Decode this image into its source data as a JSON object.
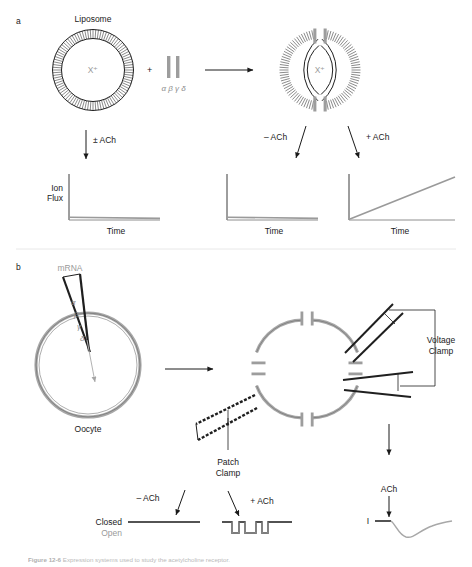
{
  "figure": {
    "panels": [
      {
        "id": "a",
        "letter": "a"
      },
      {
        "id": "b",
        "letter": "b"
      }
    ],
    "caption_prefix": "Figure 12-6",
    "caption_text": "Expression systems used to study the acetylcholine receptor."
  },
  "panel_a": {
    "letter": "a",
    "liposome_label": "Liposome",
    "ion_label": "X⁺",
    "plus_sign": "+",
    "subunits_label": "α β γ δ",
    "reconstituted_ion_label": "X⁺",
    "arrow_down_label": "± ACh",
    "minus_ach_label": "– ACh",
    "plus_ach_label": "+ ACh",
    "graphs": [
      {
        "name": "liposome-alone",
        "ylabel_line1": "Ion",
        "ylabel_line2": "Flux",
        "xlabel": "Time",
        "trace": "flat"
      },
      {
        "name": "receptor-no-ach",
        "ylabel_line1": "",
        "ylabel_line2": "",
        "xlabel": "Time",
        "trace": "flat"
      },
      {
        "name": "receptor-plus-ach",
        "ylabel_line1": "",
        "ylabel_line2": "",
        "xlabel": "Time",
        "trace": "rising"
      }
    ]
  },
  "panel_b": {
    "letter": "b",
    "mrna_label": "mRNA",
    "subunit_labels": [
      "α",
      "β",
      "γ",
      "δ"
    ],
    "oocyte_label": "Oocyte",
    "voltage_clamp_label_line1": "Voltage",
    "voltage_clamp_label_line2": "Clamp",
    "patch_clamp_label_line1": "Patch",
    "patch_clamp_label_line2": "Clamp",
    "minus_ach_label": "– ACh",
    "plus_ach_label": "+ ACh",
    "closed_label": "Closed",
    "open_label": "Open",
    "ach_label": "ACh",
    "current_label": "I"
  },
  "colors": {
    "ink": "#1a1a1a",
    "gray_trace": "#9a9a9a",
    "gray_text": "#9a9a9a",
    "membrane_gray": "#a8a8a8",
    "receptor_gray": "#9d9d9d",
    "axis": "#555555"
  },
  "chart_data": [
    {
      "type": "line",
      "name": "liposome-alone-flux",
      "title": "",
      "xlabel": "Time",
      "ylabel": "Ion Flux",
      "x": [
        0,
        1
      ],
      "values": [
        0,
        0
      ],
      "note": "No ion flux: pure liposome lacks receptor channels"
    },
    {
      "type": "line",
      "name": "receptor-liposome-minus-ach",
      "title": "",
      "xlabel": "Time",
      "ylabel": "",
      "x": [
        0,
        1
      ],
      "values": [
        0,
        0
      ],
      "note": "No ion flux without ACh: channel closed"
    },
    {
      "type": "line",
      "name": "receptor-liposome-plus-ach",
      "title": "",
      "xlabel": "Time",
      "ylabel": "",
      "x": [
        0,
        1
      ],
      "values": [
        0,
        0.85
      ],
      "note": "Linear rise in ion flux with ACh: channels open"
    },
    {
      "type": "line",
      "name": "single-channel-minus-ach",
      "title": "",
      "xlabel": "",
      "ylabel": "",
      "levels": [
        "Closed",
        "Open"
      ],
      "x": [
        0,
        1
      ],
      "values": [
        0,
        0
      ],
      "note": "Patch clamp without ACh: channel stays closed"
    },
    {
      "type": "line",
      "name": "single-channel-plus-ach",
      "title": "",
      "xlabel": "",
      "ylabel": "",
      "levels": [
        "Closed",
        "Open"
      ],
      "openings": 3,
      "note": "Patch clamp with ACh: brief square openings to the open level"
    },
    {
      "type": "line",
      "name": "whole-cell-current",
      "title": "",
      "xlabel": "",
      "ylabel": "I",
      "annotation": "ACh",
      "note": "Voltage clamp whole-cell inward current deflection after ACh application"
    }
  ]
}
